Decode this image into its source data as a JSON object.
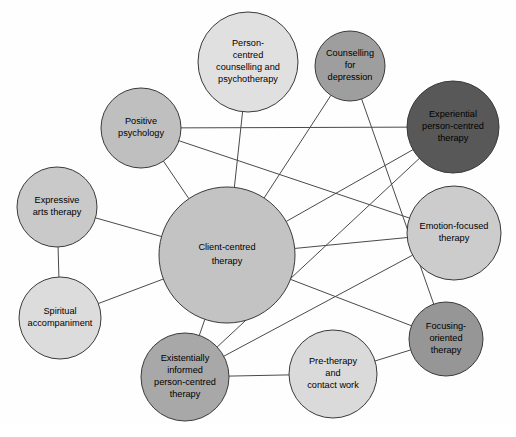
{
  "diagram": {
    "type": "network-graph",
    "background_color": "#fefefe",
    "edge_color": "#4a4a4a",
    "node_stroke_color": "#3a3a3a"
  },
  "nodes": [
    {
      "id": "client-centred-therapy",
      "label_lines": [
        "Client-centred",
        "therapy"
      ],
      "cx": 227,
      "cy": 255,
      "r": 68,
      "fill": "#c3c3c3",
      "font_size": 10.2
    },
    {
      "id": "person-centred-counselling-and-psychotherapy",
      "label_lines": [
        "Person-",
        "centred",
        "counselling and",
        "psychotherapy"
      ],
      "cx": 248,
      "cy": 62,
      "r": 50,
      "fill": "#e0e0e0",
      "font_size": 9.2
    },
    {
      "id": "counselling-for-depression",
      "label_lines": [
        "Counselling",
        "for",
        "depression"
      ],
      "cx": 350,
      "cy": 66,
      "r": 35,
      "fill": "#9e9e9e",
      "font_size": 9.2
    },
    {
      "id": "experiential-person-centred-therapy",
      "label_lines": [
        "Experiential",
        "person-centred",
        "therapy"
      ],
      "cx": 453,
      "cy": 127,
      "r": 46,
      "fill": "#585858",
      "font_size": 9.2
    },
    {
      "id": "positive-psychology",
      "label_lines": [
        "Positive",
        "psychology"
      ],
      "cx": 141,
      "cy": 128,
      "r": 40,
      "fill": "#bfbfbf",
      "font_size": 9.2
    },
    {
      "id": "emotion-focused-therapy",
      "label_lines": [
        "Emotion-focused",
        "therapy"
      ],
      "cx": 454,
      "cy": 233,
      "r": 47,
      "fill": "#cccccc",
      "font_size": 9.2
    },
    {
      "id": "expressive-arts-therapy",
      "label_lines": [
        "Expressive",
        "arts therapy"
      ],
      "cx": 57,
      "cy": 207,
      "r": 40,
      "fill": "#c9c9c9",
      "font_size": 9.2
    },
    {
      "id": "spiritual-accompaniment",
      "label_lines": [
        "Spiritual",
        "accompaniment"
      ],
      "cx": 60,
      "cy": 318,
      "r": 41,
      "fill": "#dcdcdc",
      "font_size": 9.2
    },
    {
      "id": "focusing-oriented-therapy",
      "label_lines": [
        "Focusing-",
        "oriented",
        "therapy"
      ],
      "cx": 446,
      "cy": 339,
      "r": 37,
      "fill": "#969696",
      "font_size": 9.2
    },
    {
      "id": "existentially-informed-person-centred-therapy",
      "label_lines": [
        "Existentially",
        "informed",
        "person-centred",
        "therapy"
      ],
      "cx": 185,
      "cy": 377,
      "r": 44,
      "fill": "#a8a8a8",
      "font_size": 9.2
    },
    {
      "id": "pre-therapy-and-contact-work",
      "label_lines": [
        "Pre-therapy",
        "and",
        "contact work"
      ],
      "cx": 333,
      "cy": 374,
      "r": 44,
      "fill": "#dadada",
      "font_size": 9.2
    }
  ],
  "edges": [
    {
      "from": "person-centred-counselling-and-psychotherapy",
      "to": "client-centred-therapy"
    },
    {
      "from": "positive-psychology",
      "to": "experiential-person-centred-therapy"
    },
    {
      "from": "positive-psychology",
      "to": "emotion-focused-therapy"
    },
    {
      "from": "positive-psychology",
      "to": "client-centred-therapy"
    },
    {
      "from": "expressive-arts-therapy",
      "to": "client-centred-therapy"
    },
    {
      "from": "expressive-arts-therapy",
      "to": "spiritual-accompaniment"
    },
    {
      "from": "spiritual-accompaniment",
      "to": "client-centred-therapy"
    },
    {
      "from": "client-centred-therapy",
      "to": "emotion-focused-therapy"
    },
    {
      "from": "client-centred-therapy",
      "to": "experiential-person-centred-therapy"
    },
    {
      "from": "client-centred-therapy",
      "to": "counselling-for-depression"
    },
    {
      "from": "client-centred-therapy",
      "to": "existentially-informed-person-centred-therapy"
    },
    {
      "from": "client-centred-therapy",
      "to": "focusing-oriented-therapy"
    },
    {
      "from": "counselling-for-depression",
      "to": "focusing-oriented-therapy"
    },
    {
      "from": "experiential-person-centred-therapy",
      "to": "existentially-informed-person-centred-therapy"
    },
    {
      "from": "emotion-focused-therapy",
      "to": "existentially-informed-person-centred-therapy"
    },
    {
      "from": "existentially-informed-person-centred-therapy",
      "to": "pre-therapy-and-contact-work"
    },
    {
      "from": "pre-therapy-and-contact-work",
      "to": "focusing-oriented-therapy"
    }
  ]
}
